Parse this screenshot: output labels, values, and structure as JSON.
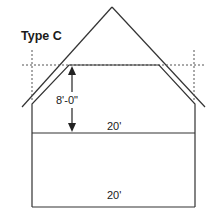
{
  "diagram": {
    "title": "Type C",
    "height_label": "8'-0\"",
    "upper_width_label": "20'",
    "lower_width_label": "20'",
    "line_color": "#333333"
  }
}
